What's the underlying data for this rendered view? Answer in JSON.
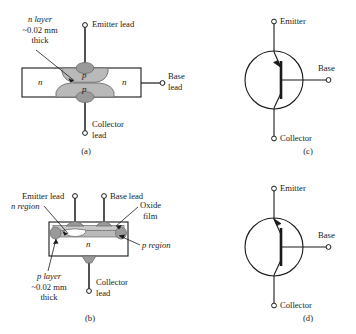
{
  "figure": {
    "colors": {
      "line": "#1a1a1a",
      "body_fill": "#ffffff",
      "region_fill": "#b9b9b9",
      "oxide_fill": "#c9c9c9",
      "contact_fill": "#9a9a9a",
      "background": "#ffffff"
    }
  },
  "panel_a": {
    "caption": "(a)",
    "layer_note_line1": "n layer",
    "layer_note_line2": "~0.02 mm",
    "layer_note_line3": "thick",
    "emitter_lead": "Emitter lead",
    "base_lead_line1": "Base",
    "base_lead_line2": "lead",
    "collector_lead_line1": "Collector",
    "collector_lead_line2": "lead",
    "region_left": "n",
    "region_right": "n",
    "region_upper": "p",
    "region_lower": "p"
  },
  "panel_b": {
    "caption": "(b)",
    "emitter_lead": "Emitter lead",
    "base_lead": "Base lead",
    "n_region_label": "n region",
    "oxide_line1": "Oxide",
    "oxide_line2": "film",
    "p_region_label": "p region",
    "layer_note_line1": "p layer",
    "layer_note_line2": "~0.02 mm",
    "layer_note_line3": "thick",
    "collector_lead_line1": "Collector",
    "collector_lead_line2": "lead",
    "body_letter": "n"
  },
  "panel_c": {
    "caption": "(c)",
    "emitter": "Emitter",
    "base": "Base",
    "collector": "Collector",
    "type": "pnp"
  },
  "panel_d": {
    "caption": "(d)",
    "emitter": "Emitter",
    "base": "Base",
    "collector": "Collector",
    "type": "npn"
  }
}
